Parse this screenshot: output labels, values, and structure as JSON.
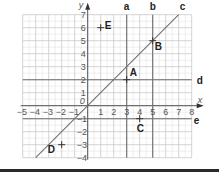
{
  "diagram": {
    "axes": {
      "x_label": "x",
      "y_label": "y",
      "x_min": -5,
      "x_max": 8,
      "y_min": -4,
      "y_max": 7,
      "origin_label": "0",
      "x_ticks": [
        "-5",
        "-4",
        "-3",
        "-2",
        "-1",
        "1",
        "2",
        "3",
        "4",
        "5",
        "6",
        "7",
        "8"
      ],
      "y_ticks": [
        "7",
        "6",
        "5",
        "4",
        "3",
        "2",
        "1",
        "-1",
        "-2",
        "-3",
        "-4"
      ]
    },
    "lines": [
      {
        "name": "a",
        "equation": "x = 3"
      },
      {
        "name": "b",
        "equation": "x = 5"
      },
      {
        "name": "c",
        "equation": "y = x"
      },
      {
        "name": "d",
        "equation": "y = 2"
      },
      {
        "name": "e",
        "equation": "y = -1"
      }
    ],
    "points": [
      {
        "name": "A",
        "x": 3,
        "y": 2
      },
      {
        "name": "B",
        "x": 5,
        "y": 5
      },
      {
        "name": "C",
        "x": 4,
        "y": -1
      },
      {
        "name": "D",
        "x": -2,
        "y": -3
      },
      {
        "name": "E",
        "x": 1,
        "y": 6
      }
    ],
    "colors": {
      "grid_major": "#c8c8c8",
      "grid_minor": "#e4e4e4",
      "line": "#6e6e6e",
      "text": "#222222",
      "axis_text": "#555555"
    }
  }
}
